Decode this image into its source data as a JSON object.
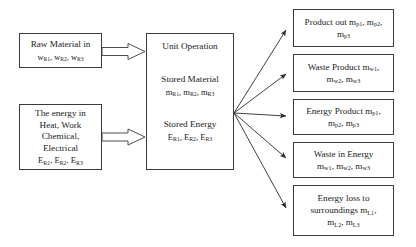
{
  "diagram": {
    "inputs": [
      {
        "id": "raw-material-in",
        "lines": [
          "Raw Material in",
          "w_R1, w_R2, w_R3"
        ],
        "label": "Raw Material in",
        "symbols": "w<sub>R1</sub>, w<sub>R2</sub>, w<sub>R3</sub>"
      },
      {
        "id": "energy-in",
        "lines": [
          "The energy in",
          "Heat, Work",
          "Chemical,",
          "Electrical",
          "E_R1, E_R2, E_R3"
        ],
        "line1": "The energy in",
        "line2": "Heat, Work",
        "line3": "Chemical,",
        "line4": "Electrical",
        "symbols": "E<sub>R1</sub>, E<sub>R2</sub>, E<sub>R3</sub>"
      }
    ],
    "process": {
      "id": "unit-operation",
      "title": "Unit Operation",
      "stored_material_label": "Stored Material",
      "stored_material_symbols": "m<sub>R1</sub>, m<sub>R2</sub>, m<sub>R3</sub>",
      "stored_energy_label": "Stored Energy",
      "stored_energy_symbols": "E<sub>R1</sub>, E<sub>R2</sub>, E<sub>R3</sub>"
    },
    "outputs": [
      {
        "id": "product-out",
        "line1": "Product out m<sub>p1</sub>, m<sub>p2</sub>,",
        "line2": "m<sub>p3</sub>",
        "text": "Product out m_p1, m_p2, m_p3"
      },
      {
        "id": "waste-product",
        "line1": "Waste Product m<sub>w1</sub>,",
        "line2": "m<sub>w2</sub>, m<sub>w3</sub>",
        "text": "Waste Product m_w1, m_w2, m_w3"
      },
      {
        "id": "energy-product",
        "line1": "Energy Product m<sub>p1</sub>,",
        "line2": "m<sub>p2</sub>, m<sub>p3</sub>",
        "text": "Energy Product m_p1, m_p2, m_p3"
      },
      {
        "id": "waste-in-energy",
        "line1": "Waste in Energy",
        "line2": "m<sub>w1</sub>, m<sub>w2</sub>, m<sub>w3</sub>",
        "text": "Waste in Energy m_w1, m_w2, m_w3"
      },
      {
        "id": "energy-loss",
        "line1": "Energy loss to",
        "line2": "surroundings m<sub>L1</sub>,",
        "line3": "m<sub>L2</sub>, m<sub>L3</sub>",
        "text": "Energy loss to surroundings m_L1, m_L2, m_L3"
      }
    ],
    "colors": {
      "border": "#3a3a3a",
      "text": "#1a1a1a",
      "arrow": "#2b2b2b",
      "background": "#ffffff"
    }
  }
}
